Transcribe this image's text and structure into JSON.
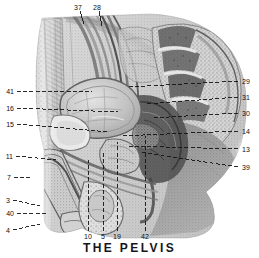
{
  "figure": {
    "title": "THE PELVIS",
    "kind": "anatomical-illustration",
    "rendering": "grayscale halftone engraving",
    "background_color": "#ffffff",
    "ink_color": "#101010"
  },
  "callouts": {
    "top": [
      {
        "number": "37",
        "x": 78,
        "y": 4,
        "leader": "solid"
      },
      {
        "number": "28",
        "x": 96,
        "y": 4,
        "leader": "solid"
      }
    ],
    "left": [
      {
        "number": "41",
        "x": 3,
        "y": 88,
        "leader": "dashed"
      },
      {
        "number": "16",
        "x": 3,
        "y": 105,
        "leader": "dashed"
      },
      {
        "number": "15",
        "x": 3,
        "y": 121,
        "leader": "dashed"
      },
      {
        "number": "11",
        "x": 3,
        "y": 153,
        "leader": "dashed"
      },
      {
        "number": "7",
        "x": 5,
        "y": 174,
        "leader": "dashed"
      },
      {
        "number": "3",
        "x": 5,
        "y": 197,
        "leader": "dashed"
      },
      {
        "number": "40",
        "x": 3,
        "y": 210,
        "leader": "dashed"
      },
      {
        "number": "4",
        "x": 5,
        "y": 227,
        "leader": "dashed"
      }
    ],
    "right": [
      {
        "number": "29",
        "x": 241,
        "y": 78,
        "leader": "dashed"
      },
      {
        "number": "31",
        "x": 241,
        "y": 94,
        "leader": "dashed"
      },
      {
        "number": "30",
        "x": 241,
        "y": 110,
        "leader": "dashed"
      },
      {
        "number": "14",
        "x": 241,
        "y": 128,
        "leader": "dashed"
      },
      {
        "number": "13",
        "x": 241,
        "y": 146,
        "leader": "dashed"
      },
      {
        "number": "39",
        "x": 241,
        "y": 164,
        "leader": "dashed"
      }
    ],
    "bottom": [
      {
        "number": "10",
        "x": 85,
        "y": 234,
        "leader": "dashed"
      },
      {
        "number": "5",
        "x": 101,
        "y": 234,
        "leader": "dashed"
      },
      {
        "number": "19",
        "x": 114,
        "y": 234,
        "leader": "dashed"
      },
      {
        "number": "42",
        "x": 142,
        "y": 234,
        "leader": "dashed"
      }
    ]
  }
}
